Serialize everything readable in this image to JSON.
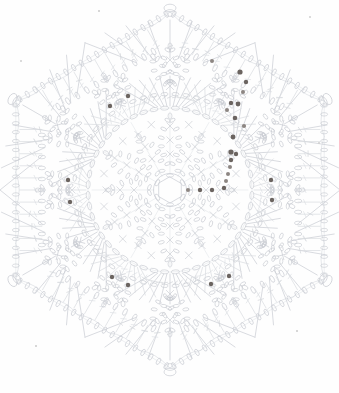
{
  "document": {
    "kind": "crochet-pattern-chart",
    "title": "Hexagonal Crochet Motif Chart",
    "shape": "hexagon",
    "symmetry_order": 6,
    "canvas": {
      "width": 339,
      "height": 393
    }
  },
  "palette": {
    "background": "#fefefe",
    "stitch_line": "#c9ccd2",
    "stitch_line_light": "#d8dbe0",
    "stitch_line_faint": "#e3e5e9",
    "marker_dot": "#6b6460",
    "marker_dot_soft": "#8d8682",
    "speck": "#cfcfcf"
  },
  "geometry": {
    "center": {
      "x": 170,
      "y": 190
    },
    "hexagon_outer_radius": 178,
    "hexagon_corner_angles_deg": [
      0,
      60,
      120,
      180,
      240,
      300
    ],
    "rings": [
      {
        "name": "center-ring",
        "radius": 13,
        "type": "chain-ring",
        "links": 6
      },
      {
        "name": "inner-petal-ring",
        "radius": 34,
        "type": "petal-loops",
        "count": 6
      },
      {
        "name": "mid-petal-ring",
        "radius": 58,
        "type": "petal-loops",
        "count": 6
      },
      {
        "name": "big-circle",
        "radius": 82,
        "type": "chain-circle",
        "links": 48
      },
      {
        "name": "fan-ring",
        "radius": 104,
        "type": "double-crochet-fan",
        "count": 6
      },
      {
        "name": "outer-flower-ring",
        "radius": 126,
        "type": "petal-cluster",
        "count": 6
      },
      {
        "name": "border-ring",
        "radius": 160,
        "type": "chain-edge",
        "count": 6
      }
    ]
  },
  "legend_symbols": [
    {
      "id": "chain-stitch",
      "label": "chain stitch",
      "glyph": "oval-link"
    },
    {
      "id": "single-crochet",
      "label": "single crochet",
      "glyph": "cross"
    },
    {
      "id": "double-crochet",
      "label": "double crochet",
      "glyph": "barred-line"
    },
    {
      "id": "picot",
      "label": "picot loop",
      "glyph": "small-loop"
    },
    {
      "id": "bead-marker",
      "label": "bead / marker",
      "glyph": "filled-dot"
    }
  ],
  "marker_dots": [
    {
      "x": 240,
      "y": 72,
      "r": 2.6,
      "tone": "dark"
    },
    {
      "x": 246,
      "y": 82,
      "r": 2.2,
      "tone": "dark"
    },
    {
      "x": 243,
      "y": 92,
      "r": 2.0,
      "tone": "soft"
    },
    {
      "x": 238,
      "y": 104,
      "r": 2.4,
      "tone": "dark"
    },
    {
      "x": 231,
      "y": 103,
      "r": 2.2,
      "tone": "dark"
    },
    {
      "x": 227,
      "y": 110,
      "r": 2.0,
      "tone": "soft"
    },
    {
      "x": 235,
      "y": 118,
      "r": 2.3,
      "tone": "dark"
    },
    {
      "x": 244,
      "y": 126,
      "r": 2.1,
      "tone": "soft"
    },
    {
      "x": 233,
      "y": 137,
      "r": 2.4,
      "tone": "dark"
    },
    {
      "x": 231,
      "y": 152,
      "r": 2.6,
      "tone": "dark"
    },
    {
      "x": 236,
      "y": 154,
      "r": 2.2,
      "tone": "dark"
    },
    {
      "x": 231,
      "y": 160,
      "r": 2.2,
      "tone": "dark"
    },
    {
      "x": 230,
      "y": 167,
      "r": 2.0,
      "tone": "soft"
    },
    {
      "x": 228,
      "y": 174,
      "r": 2.0,
      "tone": "soft"
    },
    {
      "x": 226,
      "y": 181,
      "r": 2.0,
      "tone": "soft"
    },
    {
      "x": 224,
      "y": 188,
      "r": 2.2,
      "tone": "dark"
    },
    {
      "x": 212,
      "y": 190,
      "r": 2.2,
      "tone": "dark"
    },
    {
      "x": 200,
      "y": 190,
      "r": 2.2,
      "tone": "dark"
    },
    {
      "x": 188,
      "y": 190,
      "r": 2.0,
      "tone": "soft"
    },
    {
      "x": 212,
      "y": 61,
      "r": 2.0,
      "tone": "soft"
    },
    {
      "x": 128,
      "y": 96,
      "r": 2.2,
      "tone": "dark"
    },
    {
      "x": 110,
      "y": 106,
      "r": 2.2,
      "tone": "dark"
    },
    {
      "x": 68,
      "y": 180,
      "r": 2.2,
      "tone": "dark"
    },
    {
      "x": 70,
      "y": 202,
      "r": 2.2,
      "tone": "dark"
    },
    {
      "x": 271,
      "y": 180,
      "r": 2.2,
      "tone": "dark"
    },
    {
      "x": 272,
      "y": 200,
      "r": 2.2,
      "tone": "dark"
    },
    {
      "x": 112,
      "y": 277,
      "r": 2.2,
      "tone": "dark"
    },
    {
      "x": 128,
      "y": 285,
      "r": 2.2,
      "tone": "dark"
    },
    {
      "x": 211,
      "y": 284,
      "r": 2.2,
      "tone": "dark"
    },
    {
      "x": 229,
      "y": 276,
      "r": 2.2,
      "tone": "dark"
    }
  ],
  "specks": [
    {
      "x": 20,
      "y": 60,
      "size": 2.4
    },
    {
      "x": 98,
      "y": 10,
      "size": 1.6
    },
    {
      "x": 309,
      "y": 16,
      "size": 2.0
    },
    {
      "x": 318,
      "y": 142,
      "size": 1.8
    },
    {
      "x": 35,
      "y": 345,
      "size": 1.6
    },
    {
      "x": 296,
      "y": 330,
      "size": 1.6
    }
  ]
}
